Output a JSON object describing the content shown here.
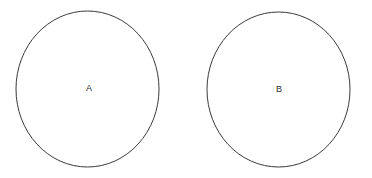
{
  "canvas": {
    "width": 372,
    "height": 178,
    "background_color": "#ffffff"
  },
  "style": {
    "stroke_color": "#3a3a3a",
    "stroke_width": 1,
    "fill": "none",
    "label_color": "#2b2b2b",
    "label_font_size": 9
  },
  "diagram": {
    "type": "two-circles",
    "shapes": [
      {
        "id": "circle-a",
        "kind": "circle",
        "label": "A",
        "cx": 87.5,
        "cy": 89,
        "rx": 71.5,
        "ry": 78,
        "label_x": 89,
        "label_y": 88
      },
      {
        "id": "circle-b",
        "kind": "circle",
        "label": "B",
        "cx": 278.5,
        "cy": 89.5,
        "rx": 71.5,
        "ry": 77.5,
        "label_x": 279,
        "label_y": 89
      }
    ]
  }
}
